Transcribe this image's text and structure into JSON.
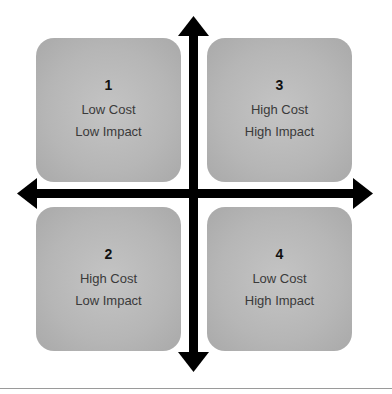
{
  "quadrants": [
    {
      "id": "q1",
      "number": "1",
      "line1": "Low Cost",
      "line2": "Low Impact"
    },
    {
      "id": "q2",
      "number": "2",
      "line1": "High Cost",
      "line2": "Low Impact"
    },
    {
      "id": "q3",
      "number": "3",
      "line1": "High Cost",
      "line2": "High Impact"
    },
    {
      "id": "q4",
      "number": "4",
      "line1": "Low Cost",
      "line2": "High Impact"
    }
  ],
  "colors": {
    "box": "#b8b8b8",
    "arrow": "#000000",
    "rule": "#9a9a9a"
  }
}
